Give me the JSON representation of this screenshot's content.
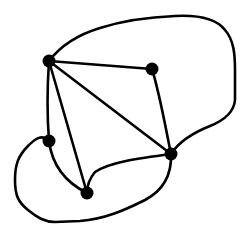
{
  "diagram": {
    "type": "planar-graph",
    "vertices": [
      {
        "id": "A",
        "x": 49,
        "y": 61
      },
      {
        "id": "B",
        "x": 152,
        "y": 69
      },
      {
        "id": "C",
        "x": 171,
        "y": 154
      },
      {
        "id": "D",
        "x": 49,
        "y": 141
      },
      {
        "id": "E",
        "x": 87,
        "y": 193
      }
    ],
    "edges": [
      {
        "from": "A",
        "to": "B",
        "shape": "straight"
      },
      {
        "from": "A",
        "to": "C",
        "shape": "straight"
      },
      {
        "from": "A",
        "to": "D",
        "shape": "straight"
      },
      {
        "from": "A",
        "to": "E",
        "shape": "straight"
      },
      {
        "from": "B",
        "to": "C",
        "shape": "curved"
      },
      {
        "from": "C",
        "to": "E",
        "shape": "curved"
      },
      {
        "from": "D",
        "to": "E",
        "shape": "curved"
      },
      {
        "from": "A",
        "to": "C",
        "shape": "outer-loop-top-right"
      },
      {
        "from": "D",
        "to": "C",
        "shape": "outer-loop-bottom-left"
      }
    ],
    "colors": {
      "stroke": "#000000",
      "vertex": "#000000",
      "background": "#ffffff"
    }
  }
}
